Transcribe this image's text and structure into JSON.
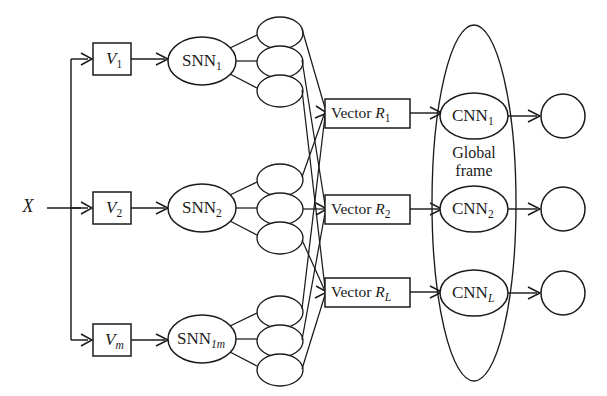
{
  "diagram": {
    "type": "block-flow-diagram",
    "background_color": "#ffffff",
    "line_color": "#1b1b1b",
    "input": {
      "label": "X",
      "name": "input-signal"
    },
    "view_boxes": [
      {
        "label": "V",
        "sub": "1",
        "sub_italic": false
      },
      {
        "label": "V",
        "sub": "2",
        "sub_italic": false
      },
      {
        "label": "V",
        "sub": "m",
        "sub_italic": true
      }
    ],
    "snn_nodes": [
      {
        "label": "SNN",
        "sub": "1",
        "sub_italic": false
      },
      {
        "label": "SNN",
        "sub": "2",
        "sub_italic": false
      },
      {
        "label": "SNN",
        "sub": "1m",
        "sub_italic": true
      }
    ],
    "feature_ellipses": {
      "groups": 3,
      "per_group": 3,
      "total": 9,
      "label": ""
    },
    "vector_boxes": [
      {
        "prefix": "Vector ",
        "symbol": "R",
        "sub": "1",
        "sub_italic": false
      },
      {
        "prefix": "Vector ",
        "symbol": "R",
        "sub": "2",
        "sub_italic": false
      },
      {
        "prefix": "Vector ",
        "symbol": "R",
        "sub": "L",
        "sub_italic": true
      }
    ],
    "global_frame": {
      "label_line1": "Global",
      "label_line2": "frame"
    },
    "cnn_nodes": [
      {
        "label": "CNN",
        "sub": "1",
        "sub_italic": false
      },
      {
        "label": "CNN",
        "sub": "2",
        "sub_italic": false
      },
      {
        "label": "CNN",
        "sub": "L",
        "sub_italic": true
      }
    ],
    "output_nodes": [
      {
        "label": ""
      },
      {
        "label": ""
      },
      {
        "label": ""
      }
    ]
  }
}
